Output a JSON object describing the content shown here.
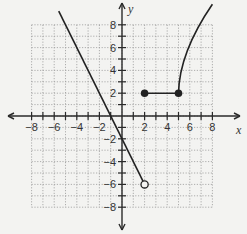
{
  "chart_data": {
    "type": "line",
    "title": "",
    "xlabel": "x",
    "ylabel": "y",
    "xlim": [
      -8,
      8
    ],
    "ylim": [
      -8,
      8
    ],
    "grid": true,
    "grid_style": "dotted",
    "x_ticks": [
      -8,
      -6,
      -4,
      -2,
      2,
      4,
      6,
      8
    ],
    "y_ticks": [
      -8,
      -6,
      -4,
      -2,
      2,
      4,
      6,
      8
    ],
    "series": [
      {
        "name": "linear piece",
        "kind": "line",
        "equation": "y = -2x - 2",
        "x_range": [
          -5.6,
          2
        ],
        "points": [
          [
            -5.6,
            9.2
          ],
          [
            0,
            -2
          ],
          [
            2,
            -6
          ]
        ],
        "endpoint": {
          "x": 2,
          "y": -6,
          "style": "open"
        }
      },
      {
        "name": "constant piece",
        "kind": "segment",
        "equation": "y = 2",
        "x_range": [
          2,
          5
        ],
        "points": [
          [
            2,
            2
          ],
          [
            5,
            2
          ]
        ],
        "endpoints": [
          {
            "x": 2,
            "y": 2,
            "style": "closed"
          },
          {
            "x": 5,
            "y": 2,
            "style": "closed"
          }
        ]
      },
      {
        "name": "curved piece",
        "kind": "curve",
        "description": "increasing concave-down curve starting at (5,2) and rising off the top of the grid",
        "points": [
          [
            5,
            2
          ],
          [
            5.3,
            4
          ],
          [
            6,
            6
          ],
          [
            7,
            8
          ],
          [
            8,
            9.8
          ]
        ]
      }
    ]
  },
  "axes": {
    "x_name": "x",
    "y_name": "y",
    "x_labels": [
      "−8",
      "−6",
      "−4",
      "−2",
      "2",
      "4",
      "6",
      "8"
    ],
    "y_labels": [
      "8",
      "6",
      "4",
      "2",
      "−2",
      "−4",
      "−6",
      "−8"
    ]
  },
  "colors": {
    "background": "#f3f3f1",
    "grid": "#9a9a9a",
    "axis": "#2a2a2a",
    "curve": "#222222"
  }
}
